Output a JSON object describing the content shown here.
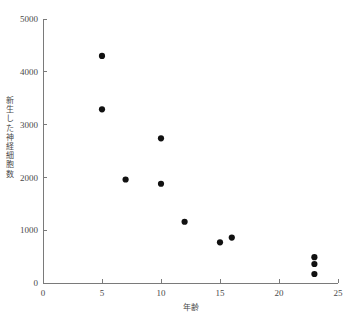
{
  "chart_data": {
    "type": "scatter",
    "title": "",
    "xlabel": "年齢",
    "ylabel": "新生した神経細胞数",
    "xlim": [
      0,
      25
    ],
    "ylim": [
      0,
      5000
    ],
    "xticks": [
      0,
      5,
      10,
      15,
      20,
      25
    ],
    "yticks": [
      0,
      1000,
      2000,
      3000,
      4000,
      5000
    ],
    "xtick_labels": [
      "0",
      "5",
      "10",
      "15",
      "20",
      "25"
    ],
    "ytick_labels": [
      "0",
      "1000",
      "2000",
      "3000",
      "4000",
      "5000"
    ],
    "grid": false,
    "legend": false,
    "marker": "filled-circle",
    "marker_color": "#111111",
    "axis_color": "#7a7a7a",
    "points": [
      {
        "x": 5,
        "y": 4300
      },
      {
        "x": 5,
        "y": 3290
      },
      {
        "x": 7,
        "y": 1960
      },
      {
        "x": 10,
        "y": 2740
      },
      {
        "x": 10,
        "y": 1880
      },
      {
        "x": 12,
        "y": 1160
      },
      {
        "x": 15,
        "y": 770
      },
      {
        "x": 16,
        "y": 860
      },
      {
        "x": 23,
        "y": 490
      },
      {
        "x": 23,
        "y": 360
      },
      {
        "x": 23,
        "y": 170
      }
    ]
  },
  "axis_titles": {
    "x": "年齢",
    "y_chars": "新\n生\nし\nた\n神\n経\n細\n胞\n数"
  }
}
